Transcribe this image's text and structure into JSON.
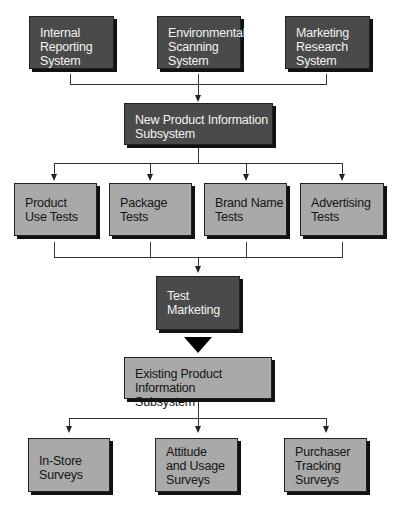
{
  "diagram": {
    "sources": [
      {
        "label": "Internal\nReporting\nSystem"
      },
      {
        "label": "Environmental\nScanning\nSystem"
      },
      {
        "label": "Marketing\nResearch\nSystem"
      }
    ],
    "new_product_subsystem": {
      "label": "New Product Information\nSubsystem"
    },
    "tests": [
      {
        "label": "Product\nUse Tests"
      },
      {
        "label": "Package\nTests"
      },
      {
        "label": "Brand Name\nTests"
      },
      {
        "label": "Advertising\nTests"
      }
    ],
    "test_marketing": {
      "label": "Test\nMarketing"
    },
    "existing_product_subsystem": {
      "label": "Existing Product Information\nSubsystem"
    },
    "surveys": [
      {
        "label": "In-Store\nSurveys"
      },
      {
        "label": "Attitude\nand Usage\nSurveys"
      },
      {
        "label": "Purchaser\nTracking\nSurveys"
      }
    ],
    "colors": {
      "dark_box": "#4a4a4a",
      "light_box": "#a9a9a9",
      "connector": "#333333"
    }
  }
}
